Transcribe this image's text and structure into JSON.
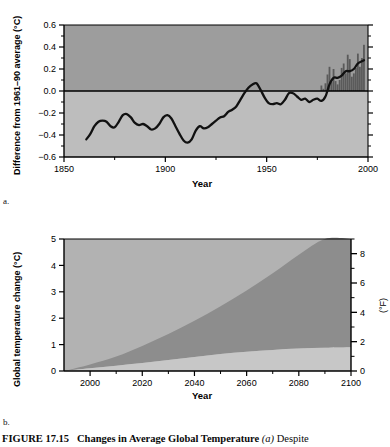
{
  "figure": {
    "number_label": "FIGURE 17.15",
    "title": "Changes in Average Global Temperature",
    "sub_a": "(a)",
    "caption_tail": "Despite",
    "panel_a_letter": "a.",
    "panel_b_letter": "b."
  },
  "chart_data": [
    {
      "type": "line",
      "id": "panel-a",
      "title": "",
      "xlabel": "Year",
      "ylabel": "Difference from 1961–90 average (°C)",
      "xlim": [
        1850,
        2000
      ],
      "ylim": [
        -0.6,
        0.6
      ],
      "xticks": [
        1850,
        1900,
        1950,
        2000
      ],
      "yticks": [
        -0.6,
        -0.4,
        -0.2,
        0.0,
        0.2,
        0.4,
        0.6
      ],
      "xtick_labels": [
        "1850",
        "1900",
        "1950",
        "2000"
      ],
      "ytick_labels": [
        "−0.6",
        "−0.4",
        "−0.2",
        "0.0",
        "0.2",
        "0.4",
        "0.6"
      ],
      "minor_xticks": [
        1875,
        1925,
        1975
      ],
      "minor_yticks": [
        -0.5,
        -0.3,
        -0.1,
        0.1,
        0.3,
        0.5
      ],
      "grid": false,
      "zero_line": 0.0,
      "legend": "none",
      "series": [
        {
          "name": "Smoothed global temperature anomaly",
          "color": "#111111",
          "x": [
            1861,
            1863,
            1865,
            1867,
            1869,
            1871,
            1873,
            1875,
            1877,
            1879,
            1881,
            1883,
            1885,
            1887,
            1889,
            1891,
            1893,
            1895,
            1897,
            1899,
            1901,
            1903,
            1905,
            1907,
            1909,
            1911,
            1913,
            1915,
            1917,
            1919,
            1921,
            1923,
            1925,
            1927,
            1929,
            1931,
            1933,
            1935,
            1937,
            1939,
            1941,
            1943,
            1945,
            1947,
            1949,
            1951,
            1953,
            1955,
            1957,
            1959,
            1961,
            1963,
            1965,
            1967,
            1969,
            1971,
            1973,
            1975,
            1977,
            1979,
            1981,
            1983,
            1985,
            1987,
            1989,
            1991,
            1993,
            1995,
            1997,
            1998
          ],
          "y": [
            -0.44,
            -0.39,
            -0.32,
            -0.28,
            -0.27,
            -0.28,
            -0.32,
            -0.33,
            -0.28,
            -0.22,
            -0.21,
            -0.24,
            -0.29,
            -0.31,
            -0.3,
            -0.32,
            -0.35,
            -0.34,
            -0.3,
            -0.24,
            -0.22,
            -0.25,
            -0.32,
            -0.39,
            -0.45,
            -0.47,
            -0.44,
            -0.36,
            -0.32,
            -0.34,
            -0.33,
            -0.3,
            -0.27,
            -0.24,
            -0.23,
            -0.19,
            -0.17,
            -0.14,
            -0.08,
            -0.02,
            0.03,
            0.06,
            0.07,
            0.01,
            -0.06,
            -0.11,
            -0.12,
            -0.11,
            -0.12,
            -0.08,
            -0.02,
            -0.02,
            -0.05,
            -0.08,
            -0.07,
            -0.1,
            -0.08,
            -0.07,
            -0.09,
            -0.05,
            0.06,
            0.12,
            0.12,
            0.14,
            0.18,
            0.18,
            0.2,
            0.25,
            0.27,
            0.28
          ]
        }
      ],
      "bars": {
        "name": "Annual values",
        "color": "#5a5a5a",
        "x": [
          1977,
          1978,
          1979,
          1980,
          1981,
          1982,
          1983,
          1984,
          1985,
          1986,
          1987,
          1988,
          1989,
          1990,
          1991,
          1992,
          1993,
          1994,
          1995,
          1996,
          1997,
          1998
        ],
        "y": [
          0.05,
          0.02,
          0.07,
          0.15,
          0.22,
          0.08,
          0.2,
          0.09,
          0.06,
          0.1,
          0.21,
          0.25,
          0.16,
          0.33,
          0.29,
          0.13,
          0.16,
          0.21,
          0.34,
          0.22,
          0.3,
          0.42
        ]
      }
    },
    {
      "type": "area",
      "id": "panel-b",
      "title": "",
      "xlabel": "Year",
      "ylabel": "Global temperature change (°C)",
      "ylabel_right": "(°F)",
      "xlim": [
        1990,
        2100
      ],
      "ylim": [
        0,
        5
      ],
      "ylim_right": [
        0,
        9
      ],
      "xticks": [
        2000,
        2020,
        2040,
        2060,
        2080,
        2100
      ],
      "xtick_labels": [
        "2000",
        "2020",
        "2040",
        "2060",
        "2080",
        "2100"
      ],
      "yticks": [
        0,
        1,
        2,
        3,
        4,
        5
      ],
      "ytick_labels": [
        "0",
        "1",
        "2",
        "3",
        "4",
        "5"
      ],
      "yticks_right": [
        0,
        2,
        4,
        6,
        8
      ],
      "ytick_labels_right": [
        "0",
        "2",
        "4",
        "6",
        "8"
      ],
      "minor_yticks_right": [
        1,
        3,
        5,
        7,
        9
      ],
      "grid": false,
      "legend": "none",
      "bands": [
        {
          "name": "Upper projection bound (high emissions)",
          "color": "#8e8e8e",
          "x": [
            1990,
            2000,
            2010,
            2020,
            2030,
            2040,
            2050,
            2060,
            2070,
            2080,
            2090,
            2100
          ],
          "y": [
            0.0,
            0.25,
            0.55,
            0.95,
            1.4,
            1.9,
            2.45,
            3.05,
            3.7,
            4.4,
            5.15,
            6.0
          ]
        },
        {
          "name": "Lower projection bound (low emissions)",
          "color": "#b9b9b9",
          "x": [
            1990,
            2000,
            2010,
            2020,
            2030,
            2040,
            2050,
            2060,
            2070,
            2080,
            2090,
            2100
          ],
          "y": [
            0.0,
            0.1,
            0.2,
            0.3,
            0.42,
            0.53,
            0.64,
            0.73,
            0.8,
            0.85,
            0.88,
            0.9
          ]
        }
      ],
      "background_color": "#b4b4b4",
      "band_fill_color": "#8e8e8e",
      "lower_fill_color": "#c6c6c6"
    }
  ],
  "colors": {
    "plot_upper_bg": "#9d9d9d",
    "plot_lower_bg": "#bdbdbd",
    "curve": "#111111",
    "bar": "#555555",
    "axis": "#000000",
    "panel_b_bg": "#b2b2b2",
    "panel_b_band": "#8d8d8d",
    "panel_b_low": "#c7c7c7"
  }
}
